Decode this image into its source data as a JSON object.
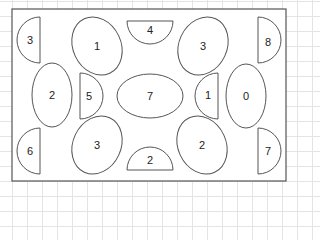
{
  "board": {
    "frame": {
      "x": 12,
      "y": 9,
      "w": 274,
      "h": 172
    },
    "pieces": [
      {
        "id": "p1",
        "type": "half-disk",
        "flat": "right",
        "value": "3",
        "cx": 40,
        "cy": 40,
        "r": 23,
        "label_x": 30,
        "label_y": 40
      },
      {
        "id": "p2",
        "type": "ellipse",
        "value": "1",
        "cx": 97,
        "cy": 46,
        "rx": 24,
        "ry": 30,
        "rot": -25
      },
      {
        "id": "p3",
        "type": "half-disk",
        "flat": "top",
        "value": "4",
        "cx": 150,
        "cy": 21,
        "r": 23,
        "label_x": 150,
        "label_y": 30
      },
      {
        "id": "p4",
        "type": "ellipse",
        "value": "3",
        "cx": 203,
        "cy": 46,
        "rx": 24,
        "ry": 30,
        "rot": 25
      },
      {
        "id": "p5",
        "type": "half-disk",
        "flat": "left",
        "value": "8",
        "cx": 258,
        "cy": 40,
        "r": 23,
        "label_x": 268,
        "label_y": 42
      },
      {
        "id": "p6",
        "type": "ellipse",
        "value": "2",
        "cx": 52,
        "cy": 95,
        "rx": 20,
        "ry": 32,
        "rot": 0
      },
      {
        "id": "p7",
        "type": "half-disk",
        "flat": "left",
        "value": "5",
        "cx": 80,
        "cy": 96,
        "r": 23,
        "label_x": 89,
        "label_y": 96
      },
      {
        "id": "p8",
        "type": "ellipse",
        "value": "7",
        "cx": 150,
        "cy": 96,
        "rx": 33,
        "ry": 22,
        "rot": 0
      },
      {
        "id": "p9",
        "type": "half-disk",
        "flat": "right",
        "value": "1",
        "cx": 218,
        "cy": 96,
        "r": 23,
        "label_x": 208,
        "label_y": 95
      },
      {
        "id": "p10",
        "type": "ellipse",
        "value": "0",
        "cx": 246,
        "cy": 96,
        "rx": 20,
        "ry": 32,
        "rot": 0
      },
      {
        "id": "p11",
        "type": "half-disk",
        "flat": "right",
        "value": "6",
        "cx": 40,
        "cy": 151,
        "r": 23,
        "label_x": 30,
        "label_y": 151
      },
      {
        "id": "p12",
        "type": "ellipse",
        "value": "3",
        "cx": 97,
        "cy": 145,
        "rx": 24,
        "ry": 30,
        "rot": 25
      },
      {
        "id": "p13",
        "type": "half-disk",
        "flat": "bottom",
        "value": "2",
        "cx": 150,
        "cy": 170,
        "r": 23,
        "label_x": 150,
        "label_y": 160
      },
      {
        "id": "p14",
        "type": "ellipse",
        "value": "2",
        "cx": 202,
        "cy": 145,
        "rx": 24,
        "ry": 30,
        "rot": -25
      },
      {
        "id": "p15",
        "type": "half-disk",
        "flat": "left",
        "value": "7",
        "cx": 258,
        "cy": 151,
        "r": 23,
        "label_x": 268,
        "label_y": 151
      }
    ]
  }
}
